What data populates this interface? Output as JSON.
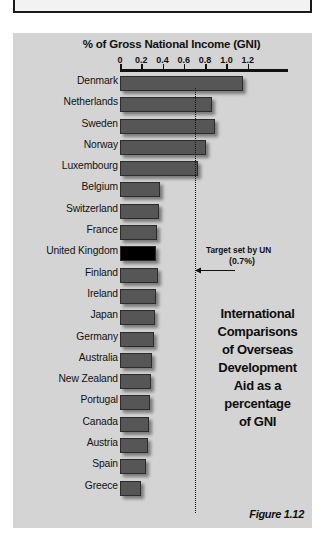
{
  "figure": {
    "label": "Figure 1.12",
    "caption_lines": [
      "International",
      "Comparisons",
      "of Overseas",
      "Development",
      "Aid as a",
      "percentage",
      "of GNI"
    ]
  },
  "annotation": {
    "line1": "Target set by UN",
    "line2": "(0.7%)",
    "arrow_icon": "left-arrow-icon"
  },
  "chart_data": {
    "type": "bar",
    "orientation": "horizontal",
    "title": "% of Gross National Income (GNI)",
    "xlabel": "% of Gross National Income (GNI)",
    "ylabel": "",
    "xlim": [
      0,
      1.3
    ],
    "ticks": [
      0,
      0.2,
      0.4,
      0.6,
      0.8,
      1.0,
      1.2
    ],
    "tick_labels": [
      "0",
      "0.2",
      "0.4",
      "0.6",
      "0.8",
      "1.0",
      "1.2"
    ],
    "grid": false,
    "legend": "none",
    "reference_line": {
      "value": 0.7,
      "label": "Target set by UN (0.7%)",
      "style": "dotted"
    },
    "highlight_category": "United Kingdom",
    "categories": [
      "Denmark",
      "Netherlands",
      "Sweden",
      "Norway",
      "Luxembourg",
      "Belgium",
      "Switzerland",
      "France",
      "United Kingdom",
      "Finland",
      "Ireland",
      "Japan",
      "Germany",
      "Australia",
      "New Zealand",
      "Portugal",
      "Canada",
      "Austria",
      "Spain",
      "Greece"
    ],
    "values": [
      1.16,
      0.86,
      0.89,
      0.81,
      0.73,
      0.38,
      0.37,
      0.35,
      0.34,
      0.36,
      0.34,
      0.33,
      0.32,
      0.3,
      0.29,
      0.28,
      0.27,
      0.26,
      0.24,
      0.2
    ]
  },
  "colors": {
    "panel_background": "#d4d4d4",
    "bar_fill": "#565656",
    "bar_highlight": "#000000",
    "axis": "#111111"
  }
}
